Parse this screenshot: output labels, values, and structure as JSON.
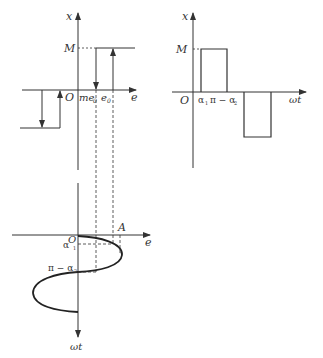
{
  "diagram": {
    "type": "relay nonlinearity describing function construction",
    "left_plot": {
      "x_axis_label": "x",
      "e_axis_label": "e",
      "origin_label": "O",
      "level_label": "M",
      "threshold_labels": [
        "me",
        "0",
        "e",
        "0"
      ],
      "me0_label": "me",
      "me0_sub": "0",
      "e0_label": "e",
      "e0_sub": "0"
    },
    "right_plot": {
      "x_axis_label": "x",
      "time_axis_label": "ωt",
      "origin_label": "O",
      "level_label": "M",
      "alpha1_label": "α",
      "alpha1_sub": "1",
      "pi_minus_alpha2_label": "π − α",
      "pi_minus_alpha2_sub": "2"
    },
    "bottom_plot": {
      "e_axis_label": "e",
      "time_axis_label": "ωt",
      "origin_label": "O",
      "amplitude_label": "A",
      "alpha1_label": "α",
      "alpha1_sub": "1",
      "pi_minus_alpha2_label": "π − α",
      "pi_minus_alpha2_sub": "2"
    },
    "colors": {
      "line": "#333333",
      "curve": "#222222"
    }
  }
}
